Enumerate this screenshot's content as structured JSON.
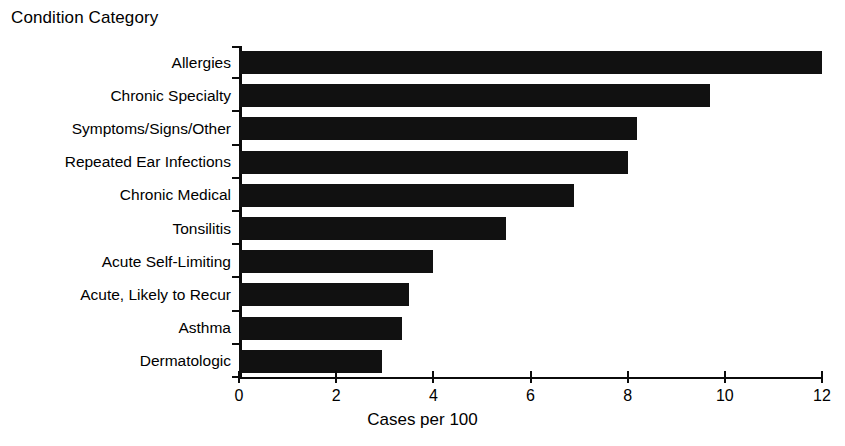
{
  "chart_data": {
    "type": "bar",
    "orientation": "horizontal",
    "title": "",
    "ylabel": "Condition Category",
    "xlabel": "Cases per 100",
    "xlim": [
      0,
      12
    ],
    "xticks": [
      0,
      2,
      4,
      6,
      8,
      10,
      12
    ],
    "xtick_labels": [
      "0",
      "2",
      "4",
      "6",
      "8",
      "10",
      "12"
    ],
    "grid": false,
    "legend": false,
    "bar_color": "#111111",
    "categories": [
      "Allergies",
      "Chronic Specialty",
      "Symptoms/Signs/Other",
      "Repeated Ear Infections",
      "Chronic Medical",
      "Tonsilitis",
      "Acute Self-Limiting",
      "Acute, Likely to Recur",
      "Asthma",
      "Dermatologic"
    ],
    "values": [
      12.0,
      9.7,
      8.2,
      8.0,
      6.9,
      5.5,
      4.0,
      3.5,
      3.35,
      2.95
    ]
  },
  "axes": {
    "y_title": "Condition Category",
    "x_title": "Cases per 100"
  }
}
